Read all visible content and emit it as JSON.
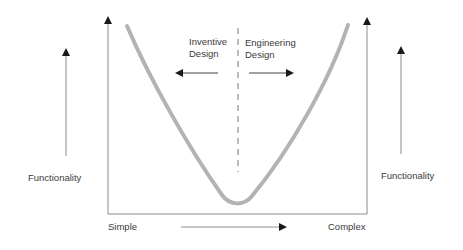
{
  "diagram": {
    "zone_labels": {
      "left": {
        "line1": "Inventive",
        "line2": "Design"
      },
      "right": {
        "line1": "Engineering",
        "line2": "Design"
      }
    },
    "axis_labels": {
      "left_functionality": "Functionality",
      "right_functionality": "Functionality",
      "x_start": "Simple",
      "x_end": "Complex"
    },
    "colors": {
      "curve": "#b3b3b3",
      "axis": "#8c8c8c",
      "arrowhead": "#1a1a1a",
      "text": "#3a3a3a"
    }
  }
}
